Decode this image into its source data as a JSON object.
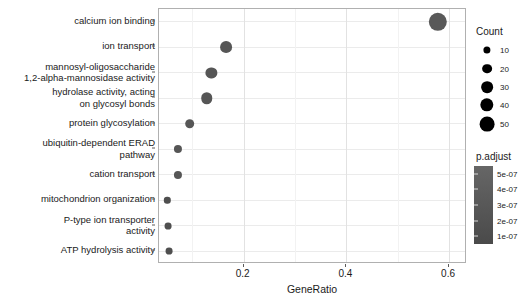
{
  "chart_data": {
    "type": "scatter",
    "title": "",
    "xlabel": "GeneRatio",
    "ylabel": "",
    "xlim": [
      0.035,
      0.635
    ],
    "xticks": [
      0.2,
      0.4,
      0.6
    ],
    "xtick_labels": [
      "0.2",
      "0.4",
      "0.6"
    ],
    "grid": true,
    "categories": [
      "calcium ion binding",
      "ion transport",
      "mannosyl-oligosaccharide\n1,2-alpha-mannosidase activity",
      "hydrolase activity, acting\non glycosyl bonds",
      "protein glycosylation",
      "ubiquitin-dependent ERAD\npathway",
      "cation transport",
      "mitochondrion organization",
      "P-type ion transporter\nactivity",
      "ATP hydrolysis activity"
    ],
    "points": [
      {
        "term": "calcium ion binding",
        "gene_ratio": 0.578,
        "count": 52,
        "p_adjust": 1e-07,
        "color": "#595959"
      },
      {
        "term": "ion transport",
        "gene_ratio": 0.165,
        "count": 24,
        "p_adjust": 3e-07,
        "color": "#565656"
      },
      {
        "term": "mannosyl-oligosaccharide 1,2-alpha-mannosidase activity",
        "gene_ratio": 0.137,
        "count": 22,
        "p_adjust": 3.5e-07,
        "color": "#565656"
      },
      {
        "term": "hydrolase activity, acting on glycosyl bonds",
        "gene_ratio": 0.128,
        "count": 23,
        "p_adjust": 3.5e-07,
        "color": "#565656"
      },
      {
        "term": "protein glycosylation",
        "gene_ratio": 0.095,
        "count": 17,
        "p_adjust": 4e-07,
        "color": "#565656"
      },
      {
        "term": "ubiquitin-dependent ERAD pathway",
        "gene_ratio": 0.072,
        "count": 13,
        "p_adjust": 4.5e-07,
        "color": "#565656"
      },
      {
        "term": "cation transport",
        "gene_ratio": 0.072,
        "count": 13,
        "p_adjust": 4.5e-07,
        "color": "#565656"
      },
      {
        "term": "mitochondrion organization",
        "gene_ratio": 0.051,
        "count": 9,
        "p_adjust": 5e-07,
        "color": "#4f4f4f"
      },
      {
        "term": "P-type ion transporter activity",
        "gene_ratio": 0.053,
        "count": 10,
        "p_adjust": 5e-07,
        "color": "#4f4f4f"
      },
      {
        "term": "ATP hydrolysis activity",
        "gene_ratio": 0.055,
        "count": 10,
        "p_adjust": 5e-07,
        "color": "#4f4f4f"
      }
    ],
    "legend_position": "right",
    "size_legend": {
      "title": "Count",
      "breaks": [
        10,
        20,
        30,
        40,
        50
      ],
      "labels": [
        "10",
        "20",
        "30",
        "40",
        "50"
      ]
    },
    "color_legend": {
      "title": "p.adjust",
      "labels": [
        "5e-07",
        "4e-07",
        "3e-07",
        "2e-07",
        "1e-07"
      ],
      "values": [
        5e-07,
        4e-07,
        3e-07,
        2e-07,
        1e-07
      ],
      "low_color": "#4a4a4a",
      "high_color": "#666666"
    }
  }
}
